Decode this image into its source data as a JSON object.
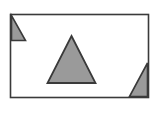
{
  "figure": {
    "canvas": {
      "width": 158,
      "height": 113,
      "background_color": "#ffffff"
    },
    "frame": {
      "name": "bounding-rectangle",
      "x": 10.5,
      "y": 14.5,
      "width": 138,
      "height": 83,
      "fill_color": "#ffffff",
      "stroke_color": "#3a3a3a",
      "stroke_width": 1.6
    },
    "shapes": [
      {
        "id": "triangle-top-left",
        "label": "Top-left clipped right triangle",
        "type": "right-triangle",
        "points": "11.5,15.5 11.5,40.5 25.5,40.5",
        "fill_color": "#9a9a9a",
        "stroke_color": "#3a3a3a",
        "stroke_width": 1.6
      },
      {
        "id": "triangle-center",
        "label": "Central isosceles triangle",
        "type": "isosceles-triangle",
        "points": "71.5,36 95.5,83 47.5,83",
        "fill_color": "#9a9a9a",
        "stroke_color": "#3a3a3a",
        "stroke_width": 1.8
      },
      {
        "id": "triangle-bottom-right",
        "label": "Bottom-right clipped right triangle",
        "type": "right-triangle",
        "points": "147.5,63 147.5,96.5 129.5,96.5",
        "fill_color": "#9a9a9a",
        "stroke_color": "#3a3a3a",
        "stroke_width": 1.6
      }
    ],
    "colors": {
      "shape_fill": "#9a9a9a",
      "outline": "#3a3a3a",
      "background": "#ffffff"
    },
    "counts": {
      "triangles": 3,
      "rectangles": 1
    }
  }
}
